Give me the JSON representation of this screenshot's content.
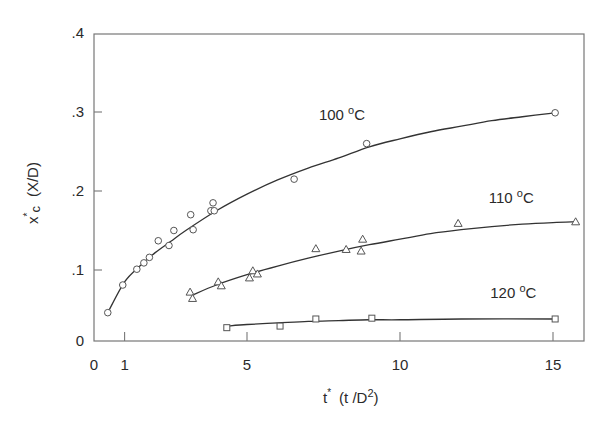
{
  "chart_data": {
    "type": "scatter",
    "title": "",
    "xlabel": "t* (t /D²)",
    "ylabel": "x*c (X/D)",
    "xlim": [
      0,
      16
    ],
    "ylim": [
      0,
      0.4
    ],
    "x_ticks": [
      0,
      1,
      5,
      10,
      15
    ],
    "x_tick_labels": [
      "0",
      "1",
      "5",
      "10",
      "15"
    ],
    "y_ticks": [
      0,
      0.1,
      0.2,
      0.3,
      0.4
    ],
    "y_tick_labels": [
      "0",
      ".1",
      ".2",
      ".3",
      ".4"
    ],
    "grid": false,
    "legend": "inline labels next to curves",
    "series": [
      {
        "name": "100 °C",
        "label_text": "100 ºC",
        "marker": "circle",
        "x": [
          0.45,
          0.94,
          1.4,
          1.63,
          1.81,
          2.1,
          2.45,
          2.61,
          3.16,
          3.24,
          3.82,
          3.93,
          3.89,
          6.54,
          8.91,
          15.07
        ],
        "y": [
          0.046,
          0.081,
          0.101,
          0.109,
          0.116,
          0.137,
          0.131,
          0.15,
          0.17,
          0.151,
          0.175,
          0.175,
          0.185,
          0.215,
          0.26,
          0.299
        ],
        "fit_curve": {
          "x": [
            0.45,
            1.0,
            1.5,
            2.0,
            2.5,
            3.0,
            4.0,
            5.0,
            6.0,
            7.0,
            8.0,
            9.0,
            10.0,
            11.0,
            12.0,
            13.0,
            14.0,
            15.07
          ],
          "y": [
            0.046,
            0.085,
            0.105,
            0.122,
            0.136,
            0.15,
            0.175,
            0.196,
            0.214,
            0.229,
            0.242,
            0.256,
            0.266,
            0.275,
            0.282,
            0.289,
            0.294,
            0.299
          ]
        }
      },
      {
        "name": "110 °C",
        "label_text": "110 ºC",
        "marker": "triangle",
        "x": [
          3.14,
          3.22,
          4.06,
          4.16,
          5.08,
          5.19,
          5.34,
          7.25,
          8.24,
          8.78,
          8.73,
          11.9,
          15.74
        ],
        "y": [
          0.072,
          0.064,
          0.085,
          0.08,
          0.09,
          0.099,
          0.095,
          0.127,
          0.126,
          0.139,
          0.124,
          0.159,
          0.161
        ],
        "fit_curve": {
          "x": [
            3.2,
            4.0,
            5.0,
            6.0,
            7.0,
            8.0,
            9.0,
            10.0,
            11.0,
            12.0,
            13.0,
            14.0,
            15.0,
            15.74
          ],
          "y": [
            0.068,
            0.081,
            0.094,
            0.105,
            0.115,
            0.124,
            0.132,
            0.139,
            0.146,
            0.151,
            0.155,
            0.158,
            0.16,
            0.161
          ]
        }
      },
      {
        "name": "120 °C",
        "label_text": "120 ºC",
        "marker": "square",
        "x": [
          4.34,
          6.08,
          7.25,
          9.08,
          15.07
        ],
        "y": [
          0.027,
          0.029,
          0.038,
          0.039,
          0.038
        ],
        "fit_curve": {
          "x": [
            4.34,
            5.0,
            6.0,
            7.0,
            8.0,
            9.0,
            10.0,
            12.0,
            15.07
          ],
          "y": [
            0.029,
            0.031,
            0.033,
            0.035,
            0.036,
            0.037,
            0.037,
            0.038,
            0.038
          ]
        }
      }
    ],
    "annotations": [
      {
        "text": "100 ºC",
        "x": 7.35,
        "y": 0.29
      },
      {
        "text": "110 ºC",
        "x": 12.9,
        "y": 0.185
      },
      {
        "text": "120 ºC",
        "x": 12.95,
        "y": 0.065
      }
    ]
  },
  "axes": {
    "x_label_main": "t",
    "x_label_sup": "*",
    "x_label_paren": "(t  /D",
    "x_label_paren_sup": "2",
    "x_label_close": ")",
    "y_label_main": "x",
    "y_label_sup": "*",
    "y_label_sub": "c",
    "y_label_paren": "(X/D)"
  }
}
